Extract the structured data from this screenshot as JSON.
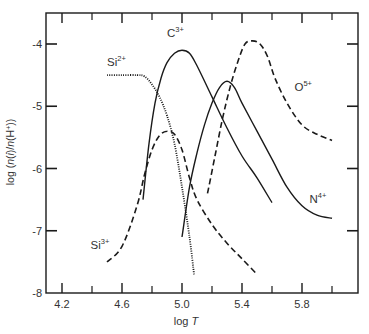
{
  "chart_data": {
    "type": "line",
    "title": "",
    "xlabel": "log T",
    "ylabel": "log (n(i)/n(H+))",
    "xlim": [
      4.09,
      6.18
    ],
    "ylim": [
      -8,
      -3.5
    ],
    "grid": false,
    "legend": "inline labels",
    "x_ticks": [
      4.2,
      4.6,
      5.0,
      5.4,
      5.8
    ],
    "x_minor_ticks": [
      4.4,
      4.8,
      5.2,
      5.6,
      6.0
    ],
    "y_ticks": [
      -4,
      -5,
      -6,
      -7,
      -8
    ],
    "series": [
      {
        "name": "Si2+",
        "label": "Si",
        "sup": "2+",
        "style": "dotted",
        "x": [
          4.5,
          4.6,
          4.7,
          4.75,
          4.8,
          4.85,
          4.9,
          4.95,
          5.0,
          5.05,
          5.08
        ],
        "y": [
          -4.5,
          -4.5,
          -4.5,
          -4.52,
          -4.65,
          -4.85,
          -5.15,
          -5.6,
          -6.3,
          -7.1,
          -7.7
        ]
      },
      {
        "name": "Si3+",
        "label": "Si",
        "sup": "3+",
        "style": "dashed",
        "x": [
          4.5,
          4.6,
          4.7,
          4.75,
          4.8,
          4.85,
          4.9,
          4.95,
          5.0,
          5.05,
          5.1,
          5.2,
          5.3,
          5.4,
          5.5
        ],
        "y": [
          -7.5,
          -7.25,
          -6.6,
          -6.1,
          -5.7,
          -5.47,
          -5.4,
          -5.45,
          -5.7,
          -6.15,
          -6.5,
          -6.9,
          -7.2,
          -7.45,
          -7.7
        ]
      },
      {
        "name": "C3+",
        "label": "C",
        "sup": "3+",
        "style": "solid",
        "x": [
          4.74,
          4.78,
          4.82,
          4.86,
          4.9,
          4.95,
          5.0,
          5.05,
          5.1,
          5.2,
          5.3,
          5.4,
          5.5,
          5.6
        ],
        "y": [
          -6.5,
          -5.6,
          -4.95,
          -4.55,
          -4.3,
          -4.15,
          -4.1,
          -4.15,
          -4.35,
          -4.85,
          -5.35,
          -5.8,
          -6.15,
          -6.55
        ]
      },
      {
        "name": "N4+",
        "label": "N",
        "sup": "4+",
        "style": "solid",
        "x": [
          5.0,
          5.05,
          5.1,
          5.15,
          5.2,
          5.25,
          5.3,
          5.35,
          5.4,
          5.5,
          5.6,
          5.7,
          5.8,
          5.9,
          6.0
        ],
        "y": [
          -7.1,
          -6.3,
          -5.75,
          -5.3,
          -4.95,
          -4.7,
          -4.6,
          -4.7,
          -4.95,
          -5.4,
          -5.85,
          -6.3,
          -6.6,
          -6.75,
          -6.8
        ]
      },
      {
        "name": "O5+",
        "label": "O",
        "sup": "5+",
        "style": "dashed",
        "x": [
          5.17,
          5.22,
          5.27,
          5.32,
          5.37,
          5.42,
          5.47,
          5.52,
          5.57,
          5.62,
          5.7,
          5.8,
          5.9,
          6.0
        ],
        "y": [
          -6.4,
          -5.8,
          -5.2,
          -4.7,
          -4.3,
          -4.0,
          -3.95,
          -4.0,
          -4.2,
          -4.55,
          -4.95,
          -5.3,
          -5.45,
          -5.55
        ]
      }
    ],
    "annotations": [
      {
        "text": "Si",
        "sup": "2+",
        "x": 4.5,
        "y": -4.35
      },
      {
        "text": "Si",
        "sup": "3+",
        "x": 4.39,
        "y": -7.3
      },
      {
        "text": "C",
        "sup": "3+",
        "x": 4.9,
        "y": -3.88
      },
      {
        "text": "N",
        "sup": "4+",
        "x": 5.85,
        "y": -6.55
      },
      {
        "text": "O",
        "sup": "5+",
        "x": 5.75,
        "y": -4.75
      }
    ]
  },
  "axis": {
    "x_label_text": "log ",
    "x_label_var": "T",
    "y_label": "log (n(i)/n(H+))",
    "x_tick_labels": [
      "4.2",
      "4.6",
      "5.0",
      "5.4",
      "5.8"
    ],
    "y_tick_labels": [
      "-4",
      "-5",
      "-6",
      "-7",
      "-8"
    ]
  },
  "colors": {
    "line": "#1a1a1a",
    "text": "#333333",
    "background": "#ffffff"
  }
}
